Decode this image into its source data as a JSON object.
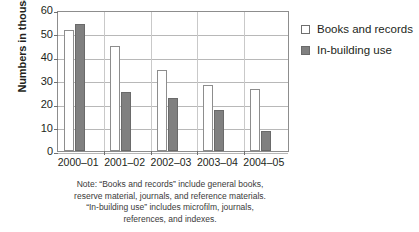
{
  "chart_data": {
    "type": "bar",
    "title": "",
    "xlabel": "",
    "ylabel": "Numbers in thousands",
    "categories": [
      "2000–01",
      "2001–02",
      "2002–03",
      "2003–04",
      "2004–05"
    ],
    "series": [
      {
        "name": "Books and records",
        "color": "#ffffff",
        "values": [
          51.5,
          44.5,
          34.5,
          28.0,
          26.5
        ]
      },
      {
        "name": "In-building use",
        "color": "#808080",
        "values": [
          54.0,
          25.0,
          22.5,
          17.5,
          8.5
        ]
      }
    ],
    "ylim": [
      0,
      60
    ],
    "yticks": [
      0,
      10,
      20,
      30,
      40,
      50,
      60
    ],
    "ytick_labels": [
      "0",
      "10",
      "20",
      "30",
      "40",
      "50",
      "60"
    ],
    "grid": "horizontal",
    "legend_position": "right"
  },
  "legend": {
    "entries": [
      {
        "label": "Books and records",
        "swatch": "white-square"
      },
      {
        "label": "In-building use",
        "swatch": "gray-square"
      }
    ]
  },
  "note": {
    "lines": [
      "Note: “Books and records” include general books,",
      "reserve material, journals, and reference materials.",
      "“In-building use” includes microfilm, journals,",
      "references, and indexes."
    ]
  }
}
